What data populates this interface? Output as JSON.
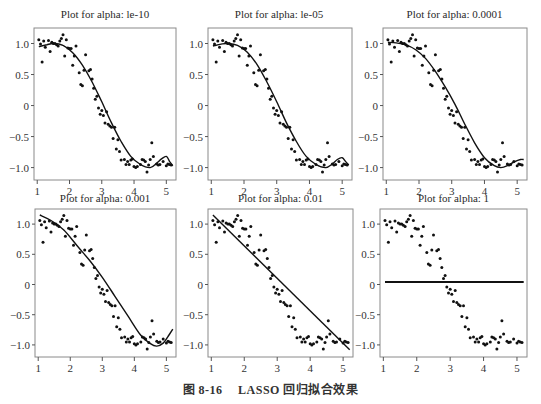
{
  "figure": {
    "caption_label": "图 8-16",
    "caption_text": "LASSO 回归拟合效果"
  },
  "chart_data": [
    {
      "type": "scatter",
      "title": "Plot for alpha: le-10",
      "xlabel": "",
      "ylabel": "",
      "xlim": [
        0.9,
        5.3
      ],
      "ylim": [
        -1.2,
        1.25
      ],
      "xticks": [
        1,
        2,
        3,
        4,
        5
      ],
      "yticks": [
        1.0,
        0.5,
        0,
        -0.5,
        -1.0
      ],
      "ytick_labels": [
        "1.0",
        "0.5",
        "0",
        "-0.5",
        "-1.0"
      ],
      "fit_line": {
        "x": [
          1.05,
          1.3,
          1.5,
          1.8,
          2.1,
          2.4,
          2.7,
          3.0,
          3.3,
          3.6,
          3.9,
          4.2,
          4.5,
          4.7,
          4.85,
          5.0,
          5.1,
          5.2
        ],
        "y": [
          0.95,
          0.98,
          1.0,
          0.97,
          0.85,
          0.65,
          0.38,
          0.06,
          -0.28,
          -0.58,
          -0.82,
          -0.95,
          -1.0,
          -0.93,
          -0.86,
          -0.82,
          -0.9,
          -0.97
        ]
      }
    },
    {
      "type": "scatter",
      "title": "Plot for alpha: le-05",
      "xlim": [
        0.9,
        5.3
      ],
      "ylim": [
        -1.2,
        1.25
      ],
      "xticks": [
        1,
        2,
        3,
        4,
        5
      ],
      "ytick_labels": [
        "1.0",
        "0.5",
        "0",
        "-0.5",
        "-1.0"
      ],
      "fit_line": {
        "x": [
          1.05,
          1.3,
          1.5,
          1.8,
          2.1,
          2.4,
          2.7,
          3.0,
          3.3,
          3.6,
          3.9,
          4.2,
          4.5,
          4.7,
          4.85,
          5.0,
          5.1,
          5.2
        ],
        "y": [
          0.96,
          0.99,
          1.0,
          0.97,
          0.86,
          0.66,
          0.38,
          0.06,
          -0.28,
          -0.58,
          -0.82,
          -0.95,
          -1.0,
          -0.94,
          -0.87,
          -0.84,
          -0.9,
          -0.96
        ]
      }
    },
    {
      "type": "scatter",
      "title": "Plot for alpha: 0.0001",
      "xlim": [
        0.9,
        5.3
      ],
      "ylim": [
        -1.2,
        1.25
      ],
      "xticks": [
        1,
        2,
        3,
        4,
        5
      ],
      "ytick_labels": [
        "1.0",
        "0.5",
        "0",
        "-0.5",
        "-1.0"
      ],
      "fit_line": {
        "x": [
          1.05,
          1.3,
          1.6,
          1.9,
          2.2,
          2.5,
          2.8,
          3.1,
          3.4,
          3.7,
          4.0,
          4.3,
          4.5,
          4.7,
          4.9,
          5.1,
          5.2
        ],
        "y": [
          1.02,
          1.01,
          0.98,
          0.9,
          0.76,
          0.55,
          0.3,
          0.02,
          -0.3,
          -0.6,
          -0.84,
          -0.97,
          -1.0,
          -0.97,
          -0.91,
          -0.87,
          -0.87
        ]
      }
    },
    {
      "type": "scatter",
      "title": "Plot for alpha: 0.001",
      "xlim": [
        0.9,
        5.3
      ],
      "ylim": [
        -1.2,
        1.25
      ],
      "xticks": [
        1,
        2,
        3,
        4,
        5
      ],
      "ytick_labels": [
        "1.0",
        "0.5",
        "0",
        "-0.5",
        "-1.0"
      ],
      "fit_line": {
        "x": [
          1.05,
          1.4,
          1.8,
          2.2,
          2.6,
          3.0,
          3.4,
          3.8,
          4.2,
          4.5,
          4.7,
          4.9,
          5.05,
          5.2
        ],
        "y": [
          1.15,
          1.06,
          0.9,
          0.65,
          0.4,
          0.12,
          -0.2,
          -0.52,
          -0.84,
          -0.98,
          -1.02,
          -0.97,
          -0.86,
          -0.74
        ]
      }
    },
    {
      "type": "scatter",
      "title": "Plot for alpha: 0.01",
      "xlim": [
        0.9,
        5.3
      ],
      "ylim": [
        -1.2,
        1.25
      ],
      "xticks": [
        1,
        2,
        3,
        4,
        5
      ],
      "ytick_labels": [
        "1.0",
        "0.5",
        "0",
        "-0.5",
        "-1.0"
      ],
      "fit_line": {
        "x": [
          1.05,
          5.2
        ],
        "y": [
          1.15,
          -1.08
        ]
      }
    },
    {
      "type": "scatter",
      "title": "Plot for alpha: 1",
      "xlim": [
        0.9,
        5.3
      ],
      "ylim": [
        -1.2,
        1.25
      ],
      "xticks": [
        1,
        2,
        3,
        4,
        5
      ],
      "ytick_labels": [
        "1.0",
        "0.5",
        "0",
        "-0.5",
        "-1.0"
      ],
      "fit_line": {
        "x": [
          1.05,
          5.2
        ],
        "y": [
          0.04,
          0.04
        ]
      }
    }
  ],
  "scatter_points": {
    "x": [
      1.05,
      1.1,
      1.15,
      1.2,
      1.25,
      1.35,
      1.4,
      1.45,
      1.5,
      1.55,
      1.6,
      1.65,
      1.7,
      1.75,
      1.8,
      1.85,
      1.9,
      1.95,
      2.0,
      2.05,
      2.1,
      2.15,
      2.2,
      2.3,
      2.35,
      2.4,
      2.45,
      2.5,
      2.6,
      2.65,
      2.7,
      2.75,
      2.8,
      2.85,
      2.9,
      2.95,
      3.0,
      3.05,
      3.1,
      3.15,
      3.2,
      3.25,
      3.3,
      3.35,
      3.4,
      3.45,
      3.5,
      3.55,
      3.6,
      3.7,
      3.75,
      3.8,
      3.85,
      3.9,
      3.95,
      4.0,
      4.05,
      4.1,
      4.2,
      4.25,
      4.3,
      4.35,
      4.4,
      4.45,
      4.5,
      4.55,
      4.6,
      4.7,
      4.75,
      4.8,
      4.9,
      5.0,
      5.05,
      5.1,
      5.15
    ],
    "y": [
      1.06,
      0.99,
      0.7,
      1.04,
      0.94,
      1.05,
      0.87,
      1.02,
      1.0,
      1.0,
      0.98,
      0.96,
      1.04,
      1.08,
      1.14,
      0.8,
      1.06,
      0.93,
      0.92,
      0.92,
      0.65,
      0.8,
      0.96,
      0.53,
      0.34,
      0.32,
      0.57,
      0.82,
      0.56,
      0.58,
      0.43,
      0.28,
      0.1,
      0.15,
      -0.04,
      -0.14,
      -0.08,
      -0.16,
      -0.28,
      -0.1,
      -0.3,
      -0.33,
      -0.35,
      -0.53,
      -0.35,
      -0.7,
      -0.55,
      -0.74,
      -0.88,
      -0.87,
      -0.95,
      -0.9,
      -0.95,
      -0.88,
      -0.86,
      -0.98,
      -1.0,
      -0.98,
      -0.95,
      -0.87,
      -0.88,
      -0.9,
      -1.07,
      -0.96,
      -0.87,
      -0.6,
      -0.82,
      -0.94,
      -0.96,
      -0.95,
      -0.9,
      -0.97,
      -0.94,
      -0.95,
      -0.96
    ]
  }
}
